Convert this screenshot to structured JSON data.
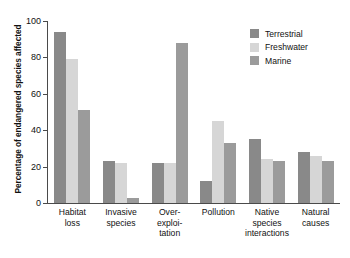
{
  "chart_data": {
    "type": "bar",
    "title": "",
    "xlabel": "",
    "ylabel": "Percentage of endangered species affected",
    "ylim": [
      0,
      100
    ],
    "yticks": [
      0,
      20,
      40,
      60,
      80,
      100
    ],
    "grid": false,
    "legend_position": "top-right",
    "categories": [
      "Habitat loss",
      "Invasive species",
      "Over-exploitation",
      "Pollution",
      "Native species interactions",
      "Natural causes"
    ],
    "category_lines": [
      [
        "Habitat",
        "loss"
      ],
      [
        "Invasive",
        "species"
      ],
      [
        "Over-",
        "exploi-",
        "tation"
      ],
      [
        "Pollution"
      ],
      [
        "Native",
        "species",
        "interactions"
      ],
      [
        "Natural",
        "causes"
      ]
    ],
    "series": [
      {
        "name": "Terrestrial",
        "color": "#898989",
        "values": [
          94,
          23,
          22,
          12,
          35,
          28
        ]
      },
      {
        "name": "Freshwater",
        "color": "#d6d6d6",
        "values": [
          79,
          22,
          22,
          45,
          24,
          26
        ]
      },
      {
        "name": "Marine",
        "color": "#9b9b9b",
        "values": [
          51,
          3,
          88,
          33,
          23,
          23
        ]
      }
    ]
  },
  "axis": {
    "y_title": "Percentage of endangered species affected",
    "tick_labels": [
      "0",
      "20",
      "40",
      "60",
      "80",
      "100"
    ]
  },
  "legend": {
    "items": [
      {
        "label": "Terrestrial",
        "color": "#898989"
      },
      {
        "label": "Freshwater",
        "color": "#d6d6d6"
      },
      {
        "label": "Marine",
        "color": "#9b9b9b"
      }
    ]
  }
}
